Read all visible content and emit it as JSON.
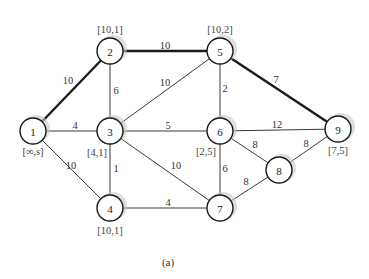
{
  "diagram": {
    "caption": "(a)",
    "nodes": [
      {
        "id": "1",
        "label": "1",
        "tag": "[∞,s]"
      },
      {
        "id": "2",
        "label": "2",
        "tag": "[10,1]"
      },
      {
        "id": "3",
        "label": "3",
        "tag": "[4,1]"
      },
      {
        "id": "4",
        "label": "4",
        "tag": "[10,1]"
      },
      {
        "id": "5",
        "label": "5",
        "tag": "[10,2]"
      },
      {
        "id": "6",
        "label": "6",
        "tag": "[2,5]"
      },
      {
        "id": "7",
        "label": "7",
        "tag": ""
      },
      {
        "id": "8",
        "label": "8",
        "tag": ""
      },
      {
        "id": "9",
        "label": "9",
        "tag": "[7,5]"
      }
    ],
    "edges": [
      {
        "from": "1",
        "to": "2",
        "weight": "10",
        "highlighted": true
      },
      {
        "from": "1",
        "to": "3",
        "weight": "4",
        "highlighted": false
      },
      {
        "from": "1",
        "to": "4",
        "weight": "10",
        "highlighted": false
      },
      {
        "from": "2",
        "to": "3",
        "weight": "6",
        "highlighted": false
      },
      {
        "from": "2",
        "to": "5",
        "weight": "10",
        "highlighted": true
      },
      {
        "from": "3",
        "to": "5",
        "weight": "10",
        "highlighted": false
      },
      {
        "from": "3",
        "to": "6",
        "weight": "5",
        "highlighted": false
      },
      {
        "from": "3",
        "to": "4",
        "weight": "1",
        "highlighted": false
      },
      {
        "from": "3",
        "to": "7",
        "weight": "10",
        "highlighted": false
      },
      {
        "from": "5",
        "to": "6",
        "weight": "2",
        "highlighted": false
      },
      {
        "from": "5",
        "to": "9",
        "weight": "7",
        "highlighted": true
      },
      {
        "from": "6",
        "to": "9",
        "weight": "12",
        "highlighted": false
      },
      {
        "from": "6",
        "to": "7",
        "weight": "6",
        "highlighted": false
      },
      {
        "from": "6",
        "to": "8",
        "weight": "8",
        "highlighted": false
      },
      {
        "from": "4",
        "to": "7",
        "weight": "4",
        "highlighted": false
      },
      {
        "from": "7",
        "to": "8",
        "weight": "8",
        "highlighted": false
      },
      {
        "from": "8",
        "to": "9",
        "weight": "8",
        "highlighted": false
      }
    ]
  }
}
